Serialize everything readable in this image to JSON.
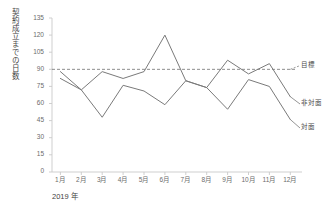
{
  "chart_data": {
    "type": "line",
    "title": "",
    "subtitle": "",
    "xlabel": "2019 年",
    "ylabel": "契約成立までの日数",
    "categories": [
      "1月",
      "2月",
      "3月",
      "4月",
      "5月",
      "6月",
      "7月",
      "8月",
      "9月",
      "10月",
      "11月",
      "12月"
    ],
    "xtick_labels": [
      "1月",
      "2月",
      "3月",
      "4月",
      "5月",
      "6月",
      "7月",
      "8月",
      "9月",
      "10月",
      "11月",
      "12月"
    ],
    "ytick_labels": [
      "0",
      "15",
      "30",
      "45",
      "60",
      "75",
      "90",
      "105",
      "120",
      "135"
    ],
    "ylim": [
      0,
      135
    ],
    "ytick_step": 15,
    "grid": false,
    "legend_position": "right-of-axes-inline",
    "series": [
      {
        "name": "非対面",
        "color": "#7a7a7a",
        "style": "solid",
        "values": [
          88,
          72,
          88,
          82,
          88,
          120,
          80,
          74,
          98,
          86,
          95,
          66
        ]
      },
      {
        "name": "対面",
        "color": "#7a7a7a",
        "style": "solid",
        "values": [
          82,
          72,
          48,
          76,
          71,
          59,
          80,
          74,
          55,
          81,
          75,
          46
        ]
      }
    ],
    "reference_lines": [
      {
        "name": "目標",
        "value": 90,
        "style": "dashed",
        "color": "#6f6f6f",
        "orientation": "horizontal"
      }
    ],
    "annotations": [
      {
        "name": "目標",
        "series_ref": "target-line"
      },
      {
        "name": "非対面",
        "series_ref": "non-face-to-face"
      },
      {
        "name": "対面",
        "series_ref": "face-to-face"
      }
    ]
  },
  "axis": {
    "y_axis_title": "契約成立までの日数",
    "x_axis_title": "2019 年"
  },
  "labels": {
    "target": "目標",
    "non_face": "非対面",
    "face": "対面"
  },
  "colors": {
    "line": "#7a7a7a",
    "dashed": "#6f6f6f",
    "axis": "#c9c9c9",
    "tick_text": "#6b6b6b",
    "title_text": "#3f3f3f",
    "background": "#ffffff"
  }
}
